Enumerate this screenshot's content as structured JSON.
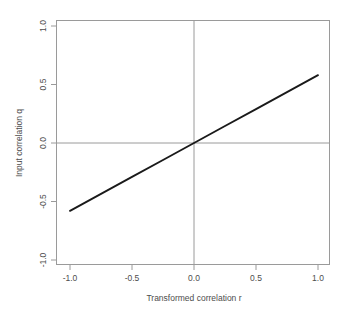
{
  "chart_data": {
    "type": "line",
    "title": "",
    "subtitle": "",
    "xlabel": "Transformed correlation r",
    "ylabel": "Input correlation q",
    "xlim": [
      -1.0,
      1.0
    ],
    "ylim": [
      -1.0,
      1.0
    ],
    "grid": false,
    "legend": null,
    "x_ticks": [
      -1.0,
      -0.5,
      0.0,
      0.5,
      1.0
    ],
    "y_ticks": [
      -1.0,
      -0.5,
      0.0,
      0.5,
      1.0
    ],
    "x_tick_labels": [
      "-1.0",
      "-0.5",
      "0.0",
      "0.5",
      "1.0"
    ],
    "y_tick_labels": [
      "-1.0",
      "-0.5",
      "0.0",
      "0.5",
      "1.0"
    ],
    "series": [
      {
        "name": "q vs r",
        "color": "#1a1a1a",
        "x": [
          -1.0,
          -0.75,
          -0.5,
          -0.25,
          0.0,
          0.25,
          0.5,
          0.75,
          1.0
        ],
        "values": [
          -0.58,
          -0.435,
          -0.29,
          -0.145,
          0.0,
          0.145,
          0.29,
          0.435,
          0.58
        ]
      }
    ],
    "reference_lines": [
      {
        "name": "vertical-zero",
        "orientation": "vertical",
        "value": 0.0,
        "color": "#9a9a9a"
      },
      {
        "name": "horizontal-zero",
        "orientation": "horizontal",
        "value": 0.0,
        "color": "#9a9a9a"
      }
    ],
    "annotations": []
  },
  "axes": {
    "x_title": "Transformed correlation r",
    "y_title": "Input correlation q",
    "x_labels": [
      "-1.0",
      "-0.5",
      "0.0",
      "0.5",
      "1.0"
    ],
    "y_labels": [
      "1.0",
      "0.5",
      "0.0",
      "-0.5",
      "-1.0"
    ]
  },
  "colors": {
    "background": "#ffffff",
    "frame": "#9a9a9a",
    "text": "#4d4d4d",
    "data_line": "#1a1a1a",
    "reference_line": "#9a9a9a"
  }
}
